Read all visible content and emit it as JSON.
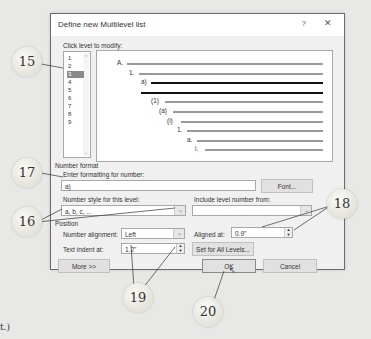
{
  "dialog": {
    "title": "Define new Multilevel list",
    "help_label": "?",
    "close_label": "✕",
    "click_level_label": "Click level to modify:",
    "levels": [
      "1",
      "2",
      "3",
      "4",
      "5",
      "6",
      "7",
      "8",
      "9"
    ],
    "selected_level": "3",
    "preview": [
      {
        "label": "A.",
        "bold": false
      },
      {
        "label": "1.",
        "bold": false
      },
      {
        "label": "a)",
        "bold": true
      },
      {
        "label": "",
        "bold": true
      },
      {
        "label": "(1)",
        "bold": false
      },
      {
        "label": "(a)",
        "bold": false
      },
      {
        "label": "(i)",
        "bold": false
      },
      {
        "label": "1.",
        "bold": false
      },
      {
        "label": "a.",
        "bold": false
      },
      {
        "label": "i.",
        "bold": false
      }
    ],
    "number_format": {
      "section_label": "Number format",
      "enter_formatting_label": "Enter formatting for number:",
      "formatting_value": "a)",
      "font_button": "Font...",
      "number_style_label": "Number style for this level:",
      "number_style_value": "a, b, c, ...",
      "include_level_label": "Include level number from:",
      "include_level_value": ""
    },
    "position": {
      "section_label": "Position",
      "number_alignment_label": "Number alignment:",
      "number_alignment_value": "Left",
      "aligned_at_label": "Aligned at:",
      "aligned_at_value": "0.9\"",
      "text_indent_label": "Text indent at:",
      "text_indent_value": "1.2\"",
      "set_all_levels_button": "Set for All Levels..."
    },
    "buttons": {
      "more": "More >>",
      "ok": "OK",
      "cancel": "Cancel"
    }
  },
  "callouts": [
    "15",
    "16",
    "17",
    "18",
    "19",
    "20"
  ],
  "footnote": "t.)"
}
